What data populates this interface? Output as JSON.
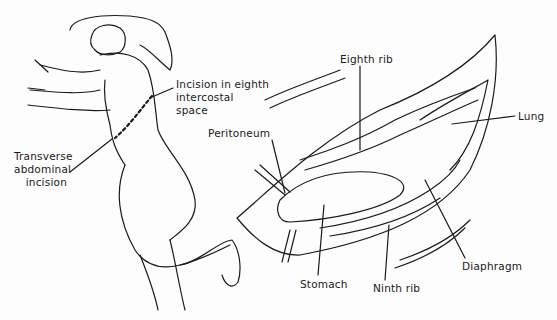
{
  "figure": {
    "left_panel": {
      "name": "patient-position",
      "labels": {
        "incision_eighth": "Incision in eighth\nintercostal\nspace",
        "transverse": "Transverse\nabdominal\nincision"
      }
    },
    "right_panel": {
      "name": "operative-field",
      "labels": {
        "eighth_rib": "Eighth rib",
        "peritoneum": "Peritoneum",
        "lung": "Lung",
        "diaphragm": "Diaphragm",
        "stomach": "Stomach",
        "ninth_rib": "Ninth rib"
      }
    }
  }
}
